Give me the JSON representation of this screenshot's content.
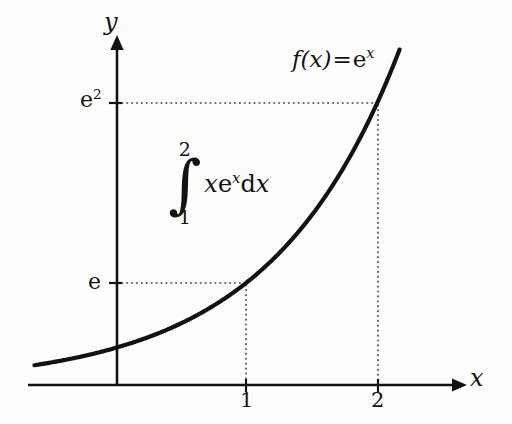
{
  "figure": {
    "background_color": "#fdfdfc",
    "ink_color": "#131313"
  },
  "axes": {
    "x_axis_label": "x",
    "y_axis_label": "y",
    "x_ticks": [
      {
        "label": "1",
        "value": 1
      },
      {
        "label": "2",
        "value": 2
      }
    ],
    "y_ticks": [
      {
        "label": "e",
        "base": "e",
        "exponent": "",
        "value": 2.718
      },
      {
        "label": "e2",
        "base": "e",
        "exponent": "2",
        "value": 7.389
      }
    ],
    "arrow_heads": [
      "x-positive",
      "y-positive"
    ]
  },
  "annotations": {
    "function_label": {
      "name": "f",
      "argument": "(x)",
      "equals": "=",
      "expression_base": "e",
      "expression_exponent": "x",
      "full_text": "f(x) = e^x"
    },
    "integral": {
      "upper_limit": "2",
      "lower_limit": "1",
      "sign": "∫",
      "integrand": "x",
      "integrand_base": "e",
      "integrand_exponent": "x",
      "differential": "dx",
      "full_text": "∫_1^2 x e^x dx"
    },
    "guide_lines": [
      {
        "from": "y-axis at e",
        "to": "curve at x=1",
        "style": "dotted"
      },
      {
        "from": "curve at x=1",
        "to": "x-axis at 1",
        "style": "dotted"
      },
      {
        "from": "y-axis at e2",
        "to": "curve at x=2",
        "style": "dotted"
      },
      {
        "from": "curve at x=2",
        "to": "x-axis at 2",
        "style": "dotted"
      }
    ]
  },
  "chart_data": {
    "type": "line",
    "title": "",
    "xlabel": "x",
    "ylabel": "y",
    "grid": false,
    "legend": false,
    "xlim": [
      -0.64,
      2.42
    ],
    "ylim": [
      0,
      8.9
    ],
    "x_tick_values": [
      1,
      2
    ],
    "x_tick_labels": [
      "1",
      "2"
    ],
    "y_tick_values": [
      2.718,
      7.389
    ],
    "y_tick_labels": [
      "e",
      "e²"
    ],
    "series": [
      {
        "name": "f(x) = e^x",
        "formula": "exp(x)",
        "x": [
          -0.64,
          -0.4,
          -0.2,
          0,
          0.2,
          0.4,
          0.6,
          0.8,
          1,
          1.2,
          1.4,
          1.6,
          1.8,
          2,
          2.2,
          2.42
        ],
        "y": [
          0.527,
          0.67,
          0.819,
          1.0,
          1.221,
          1.492,
          1.822,
          2.226,
          2.718,
          3.32,
          4.055,
          4.953,
          6.05,
          7.389,
          9.025,
          11.25
        ]
      }
    ],
    "annotations": [
      {
        "text": "f(x) = eˣ",
        "x": 1.35,
        "y": 8.3
      },
      {
        "text": "∫₁² x eˣ dx",
        "x": 0.45,
        "y": 5.6
      }
    ],
    "marked_points": [
      {
        "x": 1,
        "y": 2.718,
        "label": "(1, e)"
      },
      {
        "x": 2,
        "y": 7.389,
        "label": "(2, e²)"
      }
    ]
  }
}
